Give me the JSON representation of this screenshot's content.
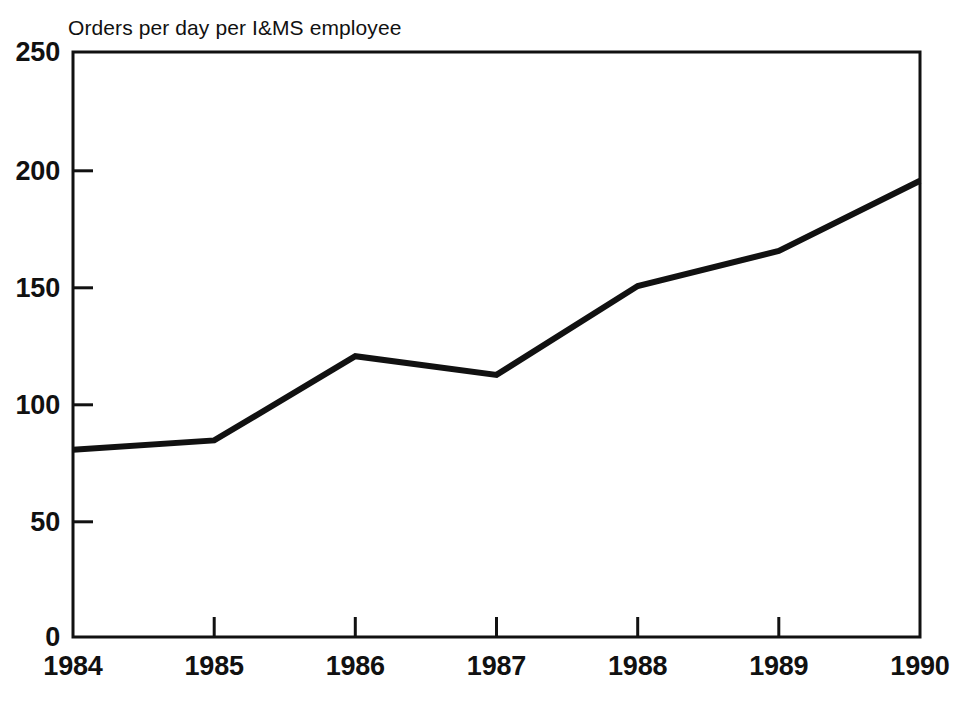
{
  "chart_data": {
    "type": "line",
    "title": "Orders per day per I&MS employee",
    "xlabel": "",
    "ylabel": "",
    "categories": [
      "1984",
      "1985",
      "1986",
      "1987",
      "1988",
      "1989",
      "1990"
    ],
    "x": [
      1984,
      1985,
      1986,
      1987,
      1988,
      1989,
      1990
    ],
    "values": [
      80,
      84,
      120,
      112,
      150,
      165,
      195
    ],
    "series": [
      {
        "name": "Orders per day per I&MS employee",
        "values": [
          80,
          84,
          120,
          112,
          150,
          165,
          195
        ]
      }
    ],
    "ylim": [
      0,
      250
    ],
    "xlim": [
      1984,
      1990
    ],
    "yticks": [
      0,
      50,
      100,
      150,
      200,
      250
    ],
    "ytick_labels": [
      "0",
      "50",
      "100",
      "150",
      "200",
      "250"
    ],
    "xticks": [
      1984,
      1985,
      1986,
      1987,
      1988,
      1989,
      1990
    ],
    "xtick_labels": [
      "1984",
      "1985",
      "1986",
      "1987",
      "1988",
      "1989",
      "1990"
    ],
    "grid": false,
    "legend": false,
    "line_color": "#111111",
    "background_color": "#ffffff"
  },
  "axes": {
    "y_labels": [
      "250",
      "200",
      "150",
      "100",
      "50",
      "0"
    ],
    "x_labels": [
      "1984",
      "1985",
      "1986",
      "1987",
      "1988",
      "1989",
      "1990"
    ]
  }
}
